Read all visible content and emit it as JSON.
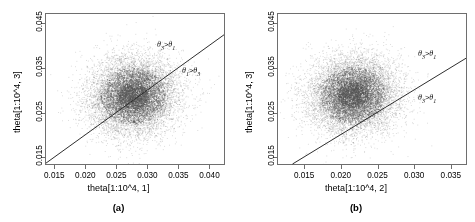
{
  "figure": {
    "background": "#ffffff",
    "point_color": "#555555",
    "line_color": "#2b2b2b",
    "axis_color": "#6e6e6e"
  },
  "panels": [
    {
      "id": "a",
      "caption": "(a)",
      "xlabel": "theta[1:10^4, 1]",
      "ylabel": "theta[1:10^4, 3]",
      "xticks": [
        "0.015",
        "0.020",
        "0.025",
        "0.030",
        "0.035",
        "0.040"
      ],
      "xtickvals": [
        0.015,
        0.02,
        0.025,
        0.03,
        0.035,
        0.04
      ],
      "yticks": [
        "0.015",
        "0.025",
        "0.035",
        "0.045"
      ],
      "ytickvals": [
        0.015,
        0.025,
        0.035,
        0.045
      ],
      "annotations": [
        {
          "name": "upper",
          "theta_a": "3",
          "theta_b": "1",
          "rel": ">"
        },
        {
          "name": "lower",
          "theta_a": "1",
          "theta_b": "3",
          "rel": ">"
        }
      ]
    },
    {
      "id": "b",
      "caption": "(b)",
      "xlabel": "theta[1:10^4, 2]",
      "ylabel": "theta[1:10^4, 3]",
      "xticks": [
        "0.015",
        "0.020",
        "0.025",
        "0.030",
        "0.035"
      ],
      "xtickvals": [
        0.015,
        0.02,
        0.025,
        0.03,
        0.035
      ],
      "yticks": [
        "0.015",
        "0.025",
        "0.035",
        "0.045"
      ],
      "ytickvals": [
        0.015,
        0.025,
        0.035,
        0.045
      ],
      "annotations": [
        {
          "name": "upper",
          "theta_a": "3",
          "theta_b": "1",
          "rel": ">"
        },
        {
          "name": "lower",
          "theta_a": "3",
          "theta_b": "1",
          "rel": ">"
        }
      ]
    }
  ],
  "chart_data": [
    {
      "type": "scatter",
      "panel": "a",
      "title": "(a)",
      "xlabel": "theta[1:10^4, 1]",
      "ylabel": "theta[1:10^4, 3]",
      "xlim": [
        0.0135,
        0.0425
      ],
      "ylim": [
        0.0133,
        0.0472
      ],
      "xticks": [
        0.015,
        0.02,
        0.025,
        0.03,
        0.035,
        0.04
      ],
      "yticks": [
        0.015,
        0.025,
        0.035,
        0.045
      ],
      "grid": false,
      "legend": null,
      "n_points": 10000,
      "point_cloud": {
        "x_mean": 0.0275,
        "y_mean": 0.029,
        "x_sd": 0.0035,
        "y_sd": 0.0042,
        "correlation": 0.08
      },
      "reference_line": {
        "equation": "y = x",
        "slope": 1,
        "intercept": 0,
        "x_start": 0.0135,
        "y_start": 0.0135,
        "x_end": 0.0425,
        "y_end": 0.0425
      },
      "annotations": [
        {
          "text": "theta_3 > theta_1",
          "x": 0.0315,
          "y": 0.0405,
          "side": "above-line"
        },
        {
          "text": "theta_1 > theta_3",
          "x": 0.037,
          "y": 0.0348,
          "side": "below-line"
        }
      ]
    },
    {
      "type": "scatter",
      "panel": "b",
      "title": "(b)",
      "xlabel": "theta[1:10^4, 2]",
      "ylabel": "theta[1:10^4, 3]",
      "xlim": [
        0.0113,
        0.0372
      ],
      "ylim": [
        0.0133,
        0.0472
      ],
      "xticks": [
        0.015,
        0.02,
        0.025,
        0.03,
        0.035
      ],
      "yticks": [
        0.015,
        0.025,
        0.035,
        0.045
      ],
      "grid": false,
      "legend": null,
      "n_points": 10000,
      "point_cloud": {
        "x_mean": 0.0215,
        "y_mean": 0.0292,
        "x_sd": 0.003,
        "y_sd": 0.0042,
        "correlation": 0.05
      },
      "reference_line": {
        "equation": "y = x",
        "slope": 1,
        "intercept": 0,
        "x_start": 0.0133,
        "y_start": 0.0133,
        "x_end": 0.0372,
        "y_end": 0.0372
      },
      "annotations": [
        {
          "text": "theta_3 > theta_1",
          "x": 0.033,
          "y": 0.04,
          "side": "above-line"
        },
        {
          "text": "theta_3 > theta_1",
          "x": 0.0322,
          "y": 0.0305,
          "side": "below-line"
        }
      ]
    }
  ]
}
